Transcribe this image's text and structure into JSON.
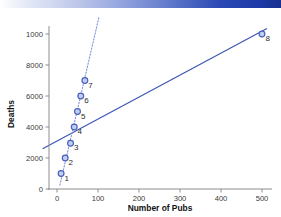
{
  "banner": {
    "name": "top-gradient-bar",
    "color_left": "#ffffff",
    "color_right": "#16308f"
  },
  "chart_data": {
    "type": "scatter",
    "title": "",
    "xlabel": "Number of Pubs",
    "ylabel": "Deaths",
    "xlim": [
      -35,
      540
    ],
    "ylim": [
      -450,
      11100
    ],
    "xticks": [
      0,
      100,
      200,
      300,
      400,
      500
    ],
    "xticklabels": [
      "0",
      "100",
      "200",
      "300",
      "400",
      "500"
    ],
    "yticks": [
      0,
      2000,
      4000,
      6000,
      8000,
      10000
    ],
    "yticklabels": [
      "0",
      "2000",
      "4000",
      "6000",
      "8000",
      "1000"
    ],
    "grid": false,
    "legend": null,
    "points": [
      {
        "label": "1",
        "x": 10,
        "y": 1000
      },
      {
        "label": "2",
        "x": 20,
        "y": 2000
      },
      {
        "label": "3",
        "x": 33,
        "y": 2950
      },
      {
        "label": "4",
        "x": 42,
        "y": 4000
      },
      {
        "label": "5",
        "x": 50,
        "y": 5000
      },
      {
        "label": "6",
        "x": 58,
        "y": 6000
      },
      {
        "label": "7",
        "x": 68,
        "y": 7000
      },
      {
        "label": "8",
        "x": 500,
        "y": 10000
      }
    ],
    "series": [
      {
        "name": "regression-line-all-points",
        "style": "solid",
        "color": "#3a55b4",
        "x": [
          -35,
          512
        ],
        "y": [
          2600,
          10350
        ]
      },
      {
        "name": "regression-line-excluding-point-8",
        "style": "dotted",
        "color": "#7e8fd6",
        "x": [
          7,
          102
        ],
        "y": [
          250,
          11050
        ]
      }
    ]
  }
}
